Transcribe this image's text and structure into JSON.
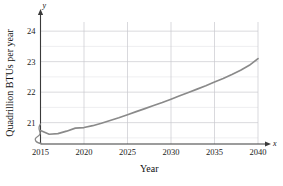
{
  "chart_data": {
    "type": "line",
    "title": "",
    "xlabel": "Year",
    "ylabel": "Quadrillion BTUs per year",
    "xlim": [
      2015,
      2040
    ],
    "ylim": [
      20.3,
      24.3
    ],
    "grid": true,
    "legend": null,
    "x_ticks": [
      "2015",
      "2020",
      "2025",
      "2030",
      "2035",
      "2040"
    ],
    "x_tick_values": [
      2015,
      2020,
      2025,
      2030,
      2035,
      2040
    ],
    "y_ticks": [
      "21",
      "22",
      "23",
      "24"
    ],
    "y_tick_values": [
      21,
      22,
      23,
      24
    ],
    "y_minor_values": [
      20.5,
      21.5,
      22.5,
      23.5
    ],
    "axis_break": "y-axis break at origin",
    "x_axis_symbol": "x",
    "y_axis_symbol": "y",
    "series": [
      {
        "name": "Energy consumption",
        "x": [
          2015,
          2016,
          2017,
          2018,
          2019,
          2020,
          2021,
          2022,
          2023,
          2024,
          2025,
          2026,
          2027,
          2028,
          2029,
          2030,
          2031,
          2032,
          2033,
          2034,
          2035,
          2036,
          2037,
          2038,
          2039,
          2040
        ],
        "values": [
          20.74,
          20.62,
          20.64,
          20.72,
          20.82,
          20.84,
          20.9,
          20.98,
          21.07,
          21.16,
          21.26,
          21.36,
          21.46,
          21.56,
          21.66,
          21.77,
          21.88,
          21.99,
          22.1,
          22.21,
          22.33,
          22.45,
          22.58,
          22.72,
          22.88,
          23.1
        ]
      }
    ]
  },
  "colors": {
    "curve": "#8a8a8a",
    "grid_major": "#c9c9cf",
    "grid_minor": "#e2e2e6",
    "axis": "#3a3a3a",
    "background": "#ffffff"
  }
}
